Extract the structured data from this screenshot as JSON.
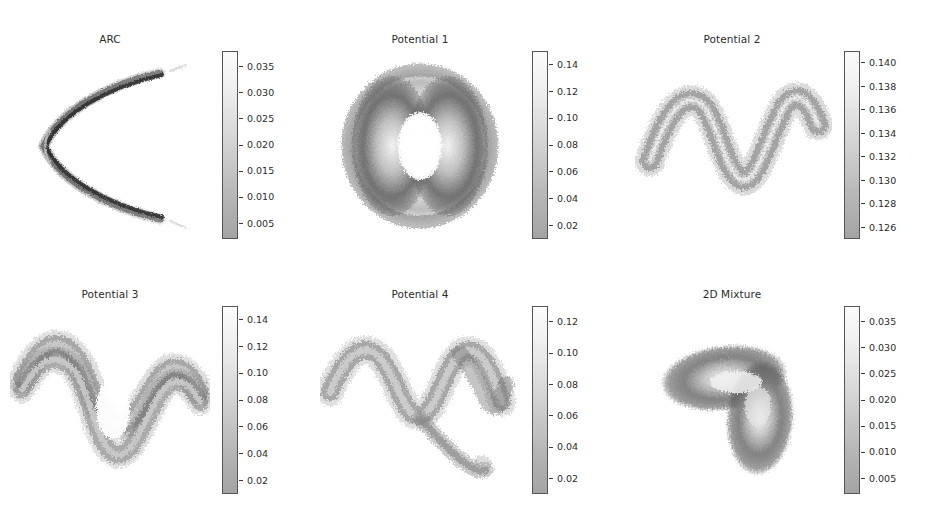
{
  "figure": {
    "background": "#ffffff",
    "layout": "2x3 grid of density plots with colorbars",
    "colormap": "grayscale-reversed"
  },
  "chart_data": [
    {
      "type": "heatmap",
      "title": "ARC",
      "xlabel": "",
      "ylabel": "",
      "colorbar_ticks": [
        "0.035",
        "0.030",
        "0.025",
        "0.020",
        "0.015",
        "0.010",
        "0.005"
      ],
      "colorbar_values": [
        0.035,
        0.03,
        0.025,
        0.02,
        0.015,
        0.01,
        0.005
      ],
      "vmin": 0.002,
      "vmax": 0.038,
      "shape": "leftward-opening parabolic arc (C shape)",
      "grid": false,
      "legend": "colorbar-right"
    },
    {
      "type": "heatmap",
      "title": "Potential 1",
      "xlabel": "",
      "ylabel": "",
      "colorbar_ticks": [
        "0.14",
        "0.12",
        "0.10",
        "0.08",
        "0.06",
        "0.04",
        "0.02"
      ],
      "colorbar_values": [
        0.14,
        0.12,
        0.1,
        0.08,
        0.06,
        0.04,
        0.02
      ],
      "vmin": 0.01,
      "vmax": 0.15,
      "shape": "two vertical crescent lobes forming a ring with hollow center",
      "grid": false,
      "legend": "colorbar-right"
    },
    {
      "type": "heatmap",
      "title": "Potential 2",
      "xlabel": "",
      "ylabel": "",
      "colorbar_ticks": [
        "0.140",
        "0.138",
        "0.136",
        "0.134",
        "0.132",
        "0.130",
        "0.128",
        "0.126"
      ],
      "colorbar_values": [
        0.14,
        0.138,
        0.136,
        0.134,
        0.132,
        0.13,
        0.128,
        0.126
      ],
      "vmin": 0.125,
      "vmax": 0.141,
      "shape": "sinusoidal wave band, two full periods",
      "grid": false,
      "legend": "colorbar-right"
    },
    {
      "type": "heatmap",
      "title": "Potential 3",
      "xlabel": "",
      "ylabel": "",
      "colorbar_ticks": [
        "0.14",
        "0.12",
        "0.10",
        "0.08",
        "0.06",
        "0.04",
        "0.02"
      ],
      "colorbar_values": [
        0.14,
        0.12,
        0.1,
        0.08,
        0.06,
        0.04,
        0.02
      ],
      "vmin": 0.01,
      "vmax": 0.15,
      "shape": "sinusoidal band splitting into two branches forming a lens-shaped hole",
      "grid": false,
      "legend": "colorbar-right"
    },
    {
      "type": "heatmap",
      "title": "Potential 4",
      "xlabel": "",
      "ylabel": "",
      "colorbar_ticks": [
        "0.12",
        "0.10",
        "0.08",
        "0.06",
        "0.04",
        "0.02"
      ],
      "colorbar_values": [
        0.12,
        0.1,
        0.08,
        0.06,
        0.04,
        0.02
      ],
      "vmin": 0.01,
      "vmax": 0.13,
      "shape": "sinusoidal band with a descending branch tail to lower right",
      "grid": false,
      "legend": "colorbar-right"
    },
    {
      "type": "heatmap",
      "title": "2D Mixture",
      "xlabel": "",
      "ylabel": "",
      "colorbar_ticks": [
        "0.035",
        "0.030",
        "0.025",
        "0.020",
        "0.015",
        "0.010",
        "0.005"
      ],
      "colorbar_values": [
        0.035,
        0.03,
        0.025,
        0.02,
        0.015,
        0.01,
        0.005
      ],
      "vmin": 0.002,
      "vmax": 0.038,
      "shape": "L-shaped / boomerang blob with bright core along the bend",
      "grid": false,
      "legend": "colorbar-right"
    }
  ],
  "panels": [
    {
      "title": "ARC",
      "left": 10,
      "top": 33,
      "cbar_left": 212
    },
    {
      "title": "Potential 1",
      "left": 320,
      "top": 33,
      "cbar_left": 212
    },
    {
      "title": "Potential 2",
      "left": 632,
      "top": 33,
      "cbar_left": 212
    },
    {
      "title": "Potential 3",
      "left": 10,
      "top": 288,
      "cbar_left": 212
    },
    {
      "title": "Potential 4",
      "left": 320,
      "top": 288,
      "cbar_left": 212
    },
    {
      "title": "2D Mixture",
      "left": 632,
      "top": 288,
      "cbar_left": 212
    }
  ]
}
